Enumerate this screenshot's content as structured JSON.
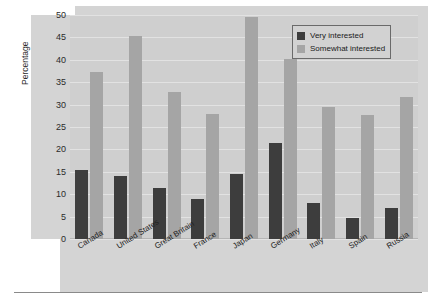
{
  "chart_data": {
    "type": "bar",
    "title": "",
    "xlabel": "",
    "ylabel": "Percentage",
    "ylim": [
      0,
      50
    ],
    "yticks": [
      50,
      45,
      40,
      35,
      30,
      25,
      20,
      15,
      10,
      5,
      0
    ],
    "grid": true,
    "legend_position": "top-right",
    "categories": [
      "Canada",
      "United States",
      "Great Britain",
      "France",
      "Japan",
      "Germany",
      "Italy",
      "Spain",
      "Russia"
    ],
    "series": [
      {
        "name": "Very interested",
        "color": "#3d3d3d",
        "values": [
          15.3,
          14,
          11.3,
          9,
          14.5,
          21.4,
          8,
          4.6,
          7
        ]
      },
      {
        "name": "Somewhat interested",
        "color": "#a5a5a5",
        "values": [
          37.3,
          45.3,
          32.8,
          27.8,
          49.6,
          40.2,
          29.4,
          27.6,
          31.8
        ]
      }
    ]
  },
  "legend": {
    "entries": [
      {
        "label": "Very interested",
        "swatch": "very"
      },
      {
        "label": "Somewhat interested",
        "swatch": "somewhat"
      }
    ]
  },
  "colors": {
    "bar_very": "#3d3d3d",
    "bar_somewhat": "#a5a5a5",
    "plot_background": "#cfcfcf",
    "panel_background": "#d4d4d4",
    "gridline": "#e2e2e2",
    "text": "#1f1f1f"
  }
}
